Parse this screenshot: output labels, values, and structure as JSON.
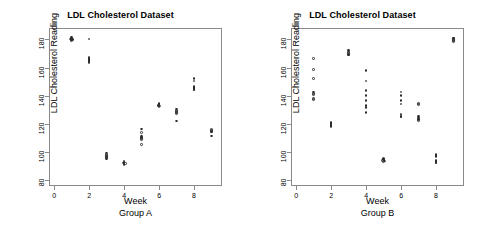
{
  "panels": [
    {
      "title": "LDL Cholesterol Dataset",
      "xlabel": "Week",
      "ylabel": "LDL Cholesterol Reading",
      "group_label": "Group A"
    },
    {
      "title": "LDL Cholesterol Dataset",
      "xlabel": "Week",
      "ylabel": "LDL Cholesterol Reading",
      "group_label": "Group B"
    }
  ],
  "axes": {
    "y_ticks": [
      "80",
      "100",
      "120",
      "140",
      "160",
      "180"
    ],
    "x_ticks": [
      "0",
      "2",
      "4",
      "6",
      "8"
    ]
  },
  "chart_data": [
    {
      "type": "scatter",
      "title": "LDL Cholesterol Dataset",
      "subtitle": "Group A",
      "xlabel": "Week",
      "ylabel": "LDL Cholesterol Reading",
      "xlim": [
        -0.3,
        9.6
      ],
      "ylim": [
        76,
        188
      ],
      "xticks": [
        0,
        2,
        4,
        6,
        8
      ],
      "yticks": [
        80,
        100,
        120,
        140,
        160,
        180
      ],
      "grid": false,
      "legend": "none",
      "marker": "open-circle",
      "series": [
        {
          "name": "Group A",
          "points": [
            {
              "x": 1,
              "y": 181.5
            },
            {
              "x": 1,
              "y": 181.0
            },
            {
              "x": 1,
              "y": 180.5
            },
            {
              "x": 1,
              "y": 180.2
            },
            {
              "x": 1,
              "y": 179.8
            },
            {
              "x": 1,
              "y": 179.4
            },
            {
              "x": 1,
              "y": 179.0
            },
            {
              "x": 2,
              "y": 180.3
            },
            {
              "x": 2,
              "y": 167.5
            },
            {
              "x": 2,
              "y": 166.8
            },
            {
              "x": 2,
              "y": 166.2
            },
            {
              "x": 2,
              "y": 165.6
            },
            {
              "x": 2,
              "y": 165.0
            },
            {
              "x": 2,
              "y": 164.4
            },
            {
              "x": 2,
              "y": 163.8
            },
            {
              "x": 2,
              "y": 163.2
            },
            {
              "x": 3,
              "y": 99.5
            },
            {
              "x": 3,
              "y": 98.5
            },
            {
              "x": 3,
              "y": 97.6
            },
            {
              "x": 3,
              "y": 97.0
            },
            {
              "x": 3,
              "y": 96.4
            },
            {
              "x": 3,
              "y": 95.8
            },
            {
              "x": 3,
              "y": 95.2
            },
            {
              "x": 4,
              "y": 93.6
            },
            {
              "x": 4,
              "y": 93.0
            },
            {
              "x": 4,
              "y": 92.6
            },
            {
              "x": 4,
              "y": 92.2
            },
            {
              "x": 4,
              "y": 91.8
            },
            {
              "x": 4,
              "y": 91.4
            },
            {
              "x": 5,
              "y": 116.5
            },
            {
              "x": 5,
              "y": 114.0
            },
            {
              "x": 5,
              "y": 111.5
            },
            {
              "x": 5,
              "y": 110.8
            },
            {
              "x": 5,
              "y": 110.2
            },
            {
              "x": 5,
              "y": 109.6
            },
            {
              "x": 5,
              "y": 109.0
            },
            {
              "x": 5,
              "y": 105.5
            },
            {
              "x": 6,
              "y": 134.5
            },
            {
              "x": 6,
              "y": 134.0
            },
            {
              "x": 6,
              "y": 133.6
            },
            {
              "x": 6,
              "y": 133.2
            },
            {
              "x": 6,
              "y": 132.8
            },
            {
              "x": 6,
              "y": 132.4
            },
            {
              "x": 7,
              "y": 130.5
            },
            {
              "x": 7,
              "y": 129.6
            },
            {
              "x": 7,
              "y": 128.8
            },
            {
              "x": 7,
              "y": 128.0
            },
            {
              "x": 7,
              "y": 127.4
            },
            {
              "x": 7,
              "y": 122.0
            },
            {
              "x": 8,
              "y": 152.0
            },
            {
              "x": 8,
              "y": 150.5
            },
            {
              "x": 8,
              "y": 146.5
            },
            {
              "x": 8,
              "y": 145.8
            },
            {
              "x": 8,
              "y": 145.2
            },
            {
              "x": 8,
              "y": 144.6
            },
            {
              "x": 8,
              "y": 144.0
            },
            {
              "x": 9,
              "y": 116.2
            },
            {
              "x": 9,
              "y": 115.4
            },
            {
              "x": 9,
              "y": 114.8
            },
            {
              "x": 9,
              "y": 114.2
            },
            {
              "x": 9,
              "y": 111.5
            }
          ]
        }
      ]
    },
    {
      "type": "scatter",
      "title": "LDL Cholesterol Dataset",
      "subtitle": "Group B",
      "xlabel": "Week",
      "ylabel": "LDL Cholesterol Reading",
      "xlim": [
        -0.3,
        9.6
      ],
      "ylim": [
        76,
        188
      ],
      "xticks": [
        0,
        2,
        4,
        6,
        8
      ],
      "yticks": [
        80,
        100,
        120,
        140,
        160,
        180
      ],
      "grid": false,
      "legend": "none",
      "marker": "open-circle",
      "series": [
        {
          "name": "Group B",
          "points": [
            {
              "x": 1,
              "y": 166.5
            },
            {
              "x": 1,
              "y": 158.5
            },
            {
              "x": 1,
              "y": 152.0
            },
            {
              "x": 1,
              "y": 142.5
            },
            {
              "x": 1,
              "y": 141.6
            },
            {
              "x": 1,
              "y": 140.8
            },
            {
              "x": 1,
              "y": 138.0
            },
            {
              "x": 1,
              "y": 137.2
            },
            {
              "x": 2,
              "y": 121.0
            },
            {
              "x": 2,
              "y": 120.4
            },
            {
              "x": 2,
              "y": 119.8
            },
            {
              "x": 2,
              "y": 119.2
            },
            {
              "x": 2,
              "y": 118.6
            },
            {
              "x": 2,
              "y": 118.0
            },
            {
              "x": 3,
              "y": 172.5
            },
            {
              "x": 3,
              "y": 171.6
            },
            {
              "x": 3,
              "y": 170.8
            },
            {
              "x": 3,
              "y": 170.0
            },
            {
              "x": 3,
              "y": 169.4
            },
            {
              "x": 3,
              "y": 168.8
            },
            {
              "x": 4,
              "y": 158.0
            },
            {
              "x": 4,
              "y": 150.5
            },
            {
              "x": 4,
              "y": 143.5
            },
            {
              "x": 4,
              "y": 140.0
            },
            {
              "x": 4,
              "y": 136.5
            },
            {
              "x": 4,
              "y": 133.0
            },
            {
              "x": 4,
              "y": 131.5
            },
            {
              "x": 4,
              "y": 128.0
            },
            {
              "x": 5,
              "y": 95.5
            },
            {
              "x": 5,
              "y": 95.0
            },
            {
              "x": 5,
              "y": 94.6
            },
            {
              "x": 5,
              "y": 94.2
            },
            {
              "x": 5,
              "y": 93.8
            },
            {
              "x": 5,
              "y": 93.4
            },
            {
              "x": 6,
              "y": 142.5
            },
            {
              "x": 6,
              "y": 140.0
            },
            {
              "x": 6,
              "y": 136.5
            },
            {
              "x": 6,
              "y": 134.0
            },
            {
              "x": 6,
              "y": 127.0
            },
            {
              "x": 6,
              "y": 126.2
            },
            {
              "x": 6,
              "y": 125.4
            },
            {
              "x": 6,
              "y": 124.8
            },
            {
              "x": 7,
              "y": 134.5
            },
            {
              "x": 7,
              "y": 133.8
            },
            {
              "x": 7,
              "y": 125.5
            },
            {
              "x": 7,
              "y": 124.8
            },
            {
              "x": 7,
              "y": 124.2
            },
            {
              "x": 7,
              "y": 123.6
            },
            {
              "x": 7,
              "y": 123.0
            },
            {
              "x": 7,
              "y": 122.4
            },
            {
              "x": 8,
              "y": 98.5
            },
            {
              "x": 8,
              "y": 97.8
            },
            {
              "x": 8,
              "y": 97.0
            },
            {
              "x": 8,
              "y": 94.0
            },
            {
              "x": 8,
              "y": 93.4
            },
            {
              "x": 8,
              "y": 92.8
            },
            {
              "x": 8,
              "y": 92.2
            },
            {
              "x": 9,
              "y": 181.0
            },
            {
              "x": 9,
              "y": 180.4
            },
            {
              "x": 9,
              "y": 179.8
            },
            {
              "x": 9,
              "y": 179.2
            },
            {
              "x": 9,
              "y": 178.6
            }
          ]
        }
      ]
    }
  ]
}
